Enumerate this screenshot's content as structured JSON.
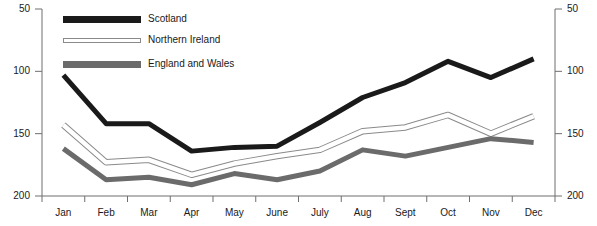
{
  "chart_data": {
    "type": "line",
    "title": "",
    "xlabel": "",
    "ylabel": "",
    "categories": [
      "Jan",
      "Feb",
      "Mar",
      "Apr",
      "May",
      "June",
      "July",
      "Aug",
      "Sept",
      "Oct",
      "Nov",
      "Dec"
    ],
    "ylim": [
      50,
      200
    ],
    "yticks": [
      50,
      100,
      150,
      200
    ],
    "grid": false,
    "legend_position": "top-left-inside",
    "dual_y_axis": true,
    "series": [
      {
        "name": "Scotland",
        "color": "#1a1a1a",
        "style": "solid-thick",
        "values": [
          147,
          108,
          108,
          86,
          89,
          90,
          109,
          129,
          141,
          158,
          145,
          160
        ]
      },
      {
        "name": "Northern Ireland",
        "color": "#ffffff",
        "stroke": "#8a8a8a",
        "style": "outlined",
        "values": [
          107,
          77,
          79,
          67,
          76,
          82,
          87,
          102,
          105,
          115,
          100,
          114
        ]
      },
      {
        "name": "England and Wales",
        "color": "#6b6b6b",
        "style": "solid-thick",
        "values": [
          88,
          63,
          65,
          59,
          68,
          63,
          70,
          87,
          82,
          89,
          96,
          93
        ]
      }
    ]
  },
  "axes": {
    "left_tick_labels": [
      "200",
      "150",
      "100",
      "50"
    ],
    "right_tick_labels": [
      "200",
      "150",
      "100",
      "50"
    ],
    "x_tick_labels": [
      "Jan",
      "Feb",
      "Mar",
      "Apr",
      "May",
      "June",
      "July",
      "Aug",
      "Sept",
      "Oct",
      "Nov",
      "Dec"
    ]
  },
  "legend": {
    "items": [
      {
        "label": "Scotland",
        "swatch": "scotland"
      },
      {
        "label": "Northern Ireland",
        "swatch": "northern-ireland"
      },
      {
        "label": "England and Wales",
        "swatch": "england-wales"
      }
    ]
  }
}
